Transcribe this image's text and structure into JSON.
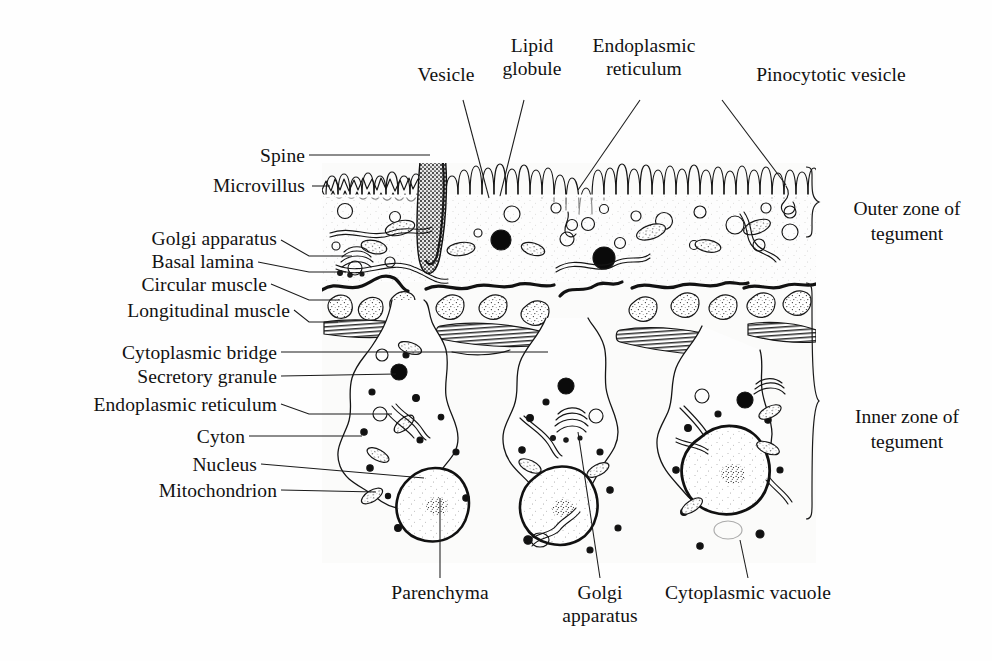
{
  "figure": {
    "ink_color": "#151515",
    "background_color": "#fefefe"
  },
  "labels": {
    "top": [
      {
        "id": "vesicle",
        "text": "Vesicle",
        "lines": [
          "Vesicle"
        ]
      },
      {
        "id": "lipid-globule",
        "text": "Lipid globule",
        "lines": [
          "Lipid",
          "globule"
        ]
      },
      {
        "id": "endoplasmic-reticulum-top",
        "text": "Endoplasmic reticulum",
        "lines": [
          "Endoplasmic",
          "reticulum"
        ]
      },
      {
        "id": "pinocytotic-vesicle",
        "text": "Pinocytotic vesicle",
        "lines": [
          "Pinocytotic vesicle"
        ]
      }
    ],
    "left": [
      {
        "id": "spine",
        "text": "Spine"
      },
      {
        "id": "microvillus",
        "text": "Microvillus"
      },
      {
        "id": "golgi-apparatus-upper",
        "text": "Golgi apparatus"
      },
      {
        "id": "basal-lamina",
        "text": "Basal lamina"
      },
      {
        "id": "circular-muscle",
        "text": "Circular muscle"
      },
      {
        "id": "longitudinal-muscle",
        "text": "Longitudinal muscle"
      },
      {
        "id": "cytoplasmic-bridge",
        "text": "Cytoplasmic bridge"
      },
      {
        "id": "secretory-granule",
        "text": "Secretory granule"
      },
      {
        "id": "endoplasmic-reticulum",
        "text": "Endoplasmic reticulum"
      },
      {
        "id": "cyton",
        "text": "Cyton"
      },
      {
        "id": "nucleus",
        "text": "Nucleus"
      },
      {
        "id": "mitochondrion",
        "text": "Mitochondrion"
      }
    ],
    "right_zones": [
      {
        "id": "outer-zone",
        "text": "Outer zone of tegument",
        "lines": [
          "Outer zone of",
          "tegument"
        ]
      },
      {
        "id": "inner-zone",
        "text": "Inner zone of tegument",
        "lines": [
          "Inner zone of",
          "tegument"
        ]
      }
    ],
    "bottom": [
      {
        "id": "parenchyma",
        "text": "Parenchyma",
        "lines": [
          "Parenchyma"
        ]
      },
      {
        "id": "golgi-apparatus-lower",
        "text": "Golgi apparatus",
        "lines": [
          "Golgi",
          "apparatus"
        ]
      },
      {
        "id": "cytoplasmic-vacuole",
        "text": "Cytoplasmic vacuole",
        "lines": [
          "Cytoplasmic vacuole"
        ]
      }
    ]
  }
}
